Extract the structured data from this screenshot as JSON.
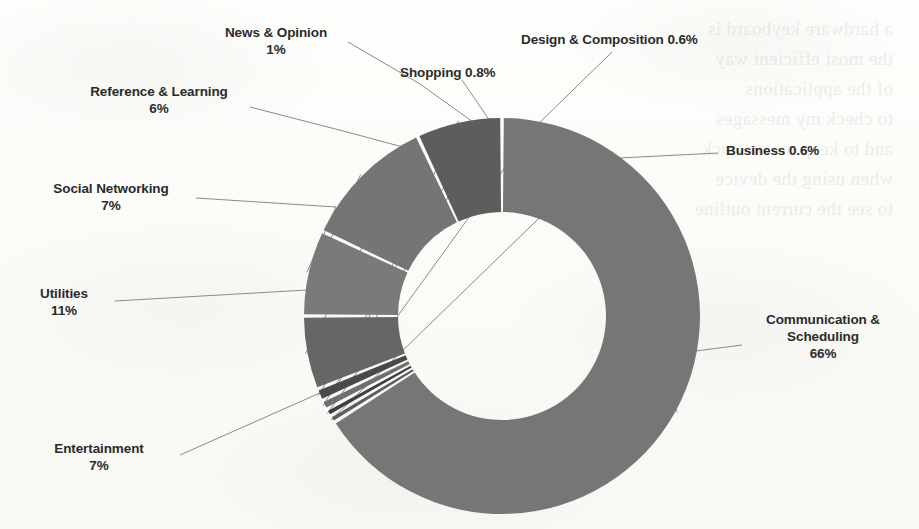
{
  "chart_data": {
    "type": "pie",
    "variant": "donut",
    "title": "",
    "subtitle": "",
    "xlabel": "",
    "ylabel": "",
    "legend_position": "none",
    "labels_outside": true,
    "leader_lines": true,
    "grid": false,
    "start_angle_deg": 0,
    "direction": "clockwise",
    "inner_radius_ratio": 0.53,
    "categories": [
      "Communication & Scheduling",
      "Business",
      "Design & Composition",
      "Shopping",
      "News & Opinion",
      "Reference & Learning",
      "Social Networking",
      "Utilities",
      "Entertainment"
    ],
    "values": [
      66,
      0.6,
      0.6,
      0.8,
      1,
      6,
      7,
      11,
      7
    ],
    "value_labels": [
      "66%",
      "0.6%",
      "0.6%",
      "0.8%",
      "1%",
      "6%",
      "7%",
      "11%",
      "7%"
    ],
    "colors": [
      "#767676",
      "#5e5e5e",
      "#3f3f3f",
      "#6f6f6f",
      "#4a4a4a",
      "#666666",
      "#7a7a7a",
      "#757575",
      "#5d5d5d"
    ],
    "units": "percent"
  },
  "chart": {
    "geometry": {
      "cx": 502,
      "cy": 316,
      "outer_r": 198,
      "inner_r": 104
    },
    "slices": [
      {
        "name": "communication-scheduling",
        "label": "Communication &",
        "label_line2": "Scheduling",
        "percent_text": "66%",
        "value": 66,
        "color": "#767676"
      },
      {
        "name": "business",
        "label": "Business 0.6%",
        "percent_text": "0.6%",
        "value": 0.6,
        "color": "#5e5e5e"
      },
      {
        "name": "design-composition",
        "label": "Design & Composition 0.6%",
        "percent_text": "0.6%",
        "value": 0.6,
        "color": "#3f3f3f"
      },
      {
        "name": "shopping",
        "label": "Shopping 0.8%",
        "percent_text": "0.8%",
        "value": 0.8,
        "color": "#6f6f6f"
      },
      {
        "name": "news-opinion",
        "label": "News & Opinion",
        "percent_text": "1%",
        "value": 1,
        "color": "#4a4a4a"
      },
      {
        "name": "reference-learning",
        "label": "Reference & Learning",
        "percent_text": "6%",
        "value": 6,
        "color": "#666666"
      },
      {
        "name": "social-networking",
        "label": "Social Networking",
        "percent_text": "7%",
        "value": 7,
        "color": "#7a7a7a"
      },
      {
        "name": "utilities",
        "label": "Utilities",
        "percent_text": "11%",
        "value": 11,
        "color": "#757575"
      },
      {
        "name": "entertainment",
        "label": "Entertainment",
        "percent_text": "7%",
        "value": 7,
        "color": "#5d5d5d"
      }
    ]
  },
  "page": {
    "background_color": "#fdfdfb",
    "text_color": "#2b2b2b",
    "leader_line_color": "#8a8a8a",
    "ghost_text": "a hardware keyboard is\nthe most efficient way\nof the applications\nto check my messages\nand to keep me on track\nwhen using the device\nto see the current outline"
  }
}
